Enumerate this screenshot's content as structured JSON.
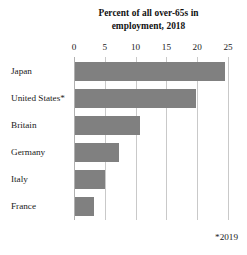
{
  "chart_data": {
    "type": "bar",
    "orientation": "horizontal",
    "title": "Percent of all over-65s in employment, 2018",
    "title_lines": [
      "Percent of all over-65s in",
      "employment, 2018"
    ],
    "categories": [
      "Japan",
      "United States*",
      "Britain",
      "Germany",
      "Italy",
      "France"
    ],
    "values": [
      24.3,
      19.6,
      10.5,
      7.2,
      4.8,
      3.1
    ],
    "xlabel": "",
    "ylabel": "",
    "xlim": [
      0,
      25
    ],
    "xticks": [
      0,
      5,
      10,
      15,
      20,
      25
    ],
    "xtick_labels": [
      "0",
      "5",
      "10",
      "15",
      "20",
      "25"
    ],
    "axis_position": "top",
    "grid": true,
    "grid_axis": "x",
    "legend": false,
    "footnote": "*2019",
    "bar_color": "#808080",
    "grid_color": "#c9c9c9",
    "background": "#ffffff"
  }
}
